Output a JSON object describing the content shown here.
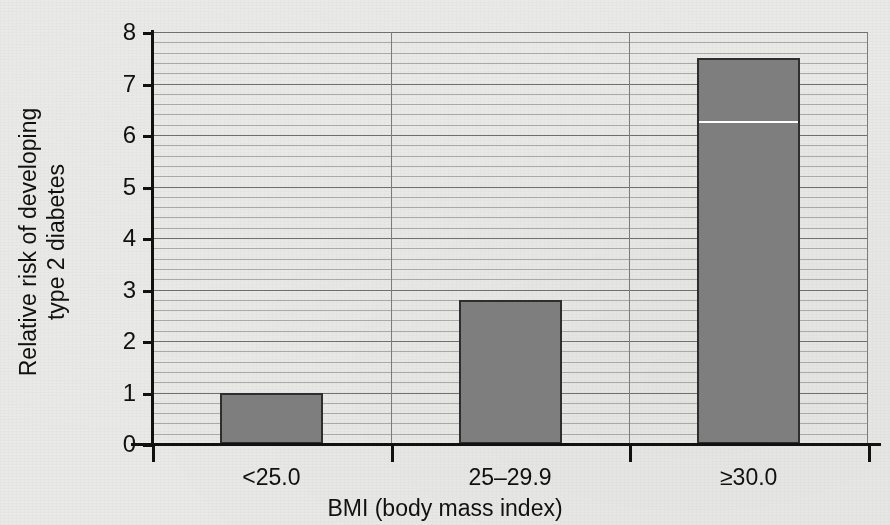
{
  "chart_data": {
    "type": "bar",
    "title": "",
    "subtitle": "",
    "xlabel": "BMI (body mass index)",
    "ylabel_line1": "Relative risk of developing",
    "ylabel_line2": "type 2 diabetes",
    "ylabel": "Relative risk of developing type 2 diabetes",
    "categories": [
      "<25.0",
      "25–29.9",
      "≥30.0"
    ],
    "values": [
      1.0,
      2.8,
      7.5
    ],
    "ylim": [
      0,
      8
    ],
    "xlim_categories": 3,
    "y_major_ticks": [
      0,
      1,
      2,
      3,
      4,
      5,
      6,
      7,
      8
    ],
    "y_tick_labels": [
      "0",
      "1",
      "2",
      "3",
      "4",
      "5",
      "6",
      "7",
      "8"
    ],
    "y_minor_step": 0.2,
    "grid": "horizontal-major-and-minor",
    "category_dividers": true,
    "legend": "none",
    "annotations": [
      {
        "kind": "white-streak-artifact",
        "series_index": 2,
        "value": 6.27,
        "note": "thin white horizontal line crossing the third bar"
      }
    ],
    "bar_fill_color": "#7e7e7e",
    "bar_border_color": "#2e2e2e",
    "background_color": "#e9e9e7",
    "axis_color": "#111111",
    "major_grid_color": "#6f6f6d",
    "minor_grid_color": "#a9a9a7"
  }
}
